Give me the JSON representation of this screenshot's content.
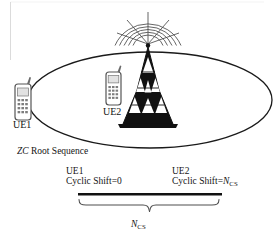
{
  "figure": {
    "background_color": "#ffffff",
    "line_color": "#1a1a1a"
  },
  "cell": {
    "ellipse_label": "cell-coverage-ellipse",
    "base_station": {
      "name": "base-station-tower",
      "signal_arcs": 5
    }
  },
  "devices": [
    {
      "id": "ue1",
      "label": "UE1",
      "icon": "mobile-phone-icon"
    },
    {
      "id": "ue2",
      "label": "UE2",
      "icon": "mobile-phone-icon"
    }
  ],
  "sequence": {
    "root_label_italic": "ZC",
    "root_label_rest": " Root Sequence"
  },
  "shifts": [
    {
      "id": "ue1-shift",
      "ue": "UE1",
      "prefix": "Cyclic Shift=",
      "value": "0",
      "value_is_math": false
    },
    {
      "id": "ue2-shift",
      "ue": "UE2",
      "prefix": "Cyclic Shift=",
      "value_symbol": "N",
      "value_subscript": "CS",
      "value_is_math": true
    }
  ],
  "brace": {
    "name": "ncs-span-brace",
    "label_symbol": "N",
    "label_subscript": "CS"
  }
}
